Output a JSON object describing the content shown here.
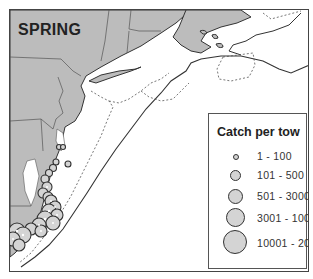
{
  "map": {
    "title": "SPRING",
    "land_color": "#bcbcbc",
    "water_color": "#ffffff",
    "coastline_color": "#333333",
    "isobath_style": "dashed",
    "symbol_fill": "#d4d4d4",
    "symbol_stroke": "#333333"
  },
  "legend": {
    "title": "Catch per tow",
    "items": [
      {
        "label": "1 - 100",
        "size": 6
      },
      {
        "label": "101 - 500",
        "size": 11
      },
      {
        "label": "501 - 3000",
        "size": 15
      },
      {
        "label": "3001 - 10000",
        "size": 19
      },
      {
        "label": "10001 - 20000",
        "size": 24
      }
    ]
  }
}
